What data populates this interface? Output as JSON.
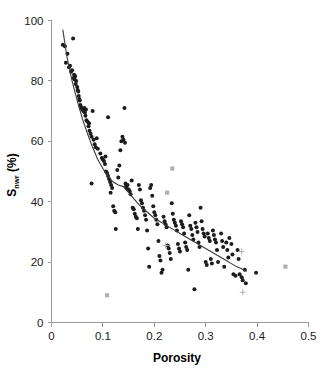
{
  "figure": {
    "width": 322,
    "height": 369,
    "background": "#ffffff",
    "top_fragment": "",
    "marker_color_dark": "#1c1c1c",
    "marker_color_gray": "#b0b0b0",
    "curve_color": "#3b3b3b",
    "axis_color": "#9a9a9a"
  },
  "chart_data": {
    "type": "scatter",
    "title": "",
    "subtitle": "",
    "xlabel": "Porosity",
    "ylabel_main": "S",
    "ylabel_sub": "nwr",
    "ylabel_unit": " (%)",
    "ylabel": "Snwr (%)",
    "xlim": [
      0,
      0.5
    ],
    "ylim": [
      0,
      100
    ],
    "xticks": [
      0,
      0.1,
      0.2,
      0.3,
      0.4,
      0.5
    ],
    "xticklabels": [
      "0",
      "0.1",
      "0.2",
      "0.3",
      "0.4",
      "0.5"
    ],
    "yticks": [
      0,
      20,
      40,
      60,
      80,
      100
    ],
    "yticklabels": [
      "0",
      "20",
      "40",
      "60",
      "80",
      "100"
    ],
    "grid": false,
    "legend": null,
    "annotations": [],
    "series": [
      {
        "name": "measurements-dark",
        "marker": "filled-circle",
        "color": "#1c1c1c",
        "points": [
          [
            0.022,
            92.0
          ],
          [
            0.026,
            91.5
          ],
          [
            0.028,
            86.0
          ],
          [
            0.031,
            89.0
          ],
          [
            0.034,
            84.5
          ],
          [
            0.036,
            85.0
          ],
          [
            0.038,
            83.0
          ],
          [
            0.04,
            83.5
          ],
          [
            0.042,
            94.0
          ],
          [
            0.043,
            81.0
          ],
          [
            0.044,
            82.0
          ],
          [
            0.045,
            80.5
          ],
          [
            0.046,
            81.5
          ],
          [
            0.047,
            79.0
          ],
          [
            0.048,
            80.0
          ],
          [
            0.05,
            78.0
          ],
          [
            0.051,
            77.0
          ],
          [
            0.052,
            76.5
          ],
          [
            0.053,
            75.0
          ],
          [
            0.054,
            74.0
          ],
          [
            0.055,
            73.5
          ],
          [
            0.056,
            72.0
          ],
          [
            0.057,
            71.5
          ],
          [
            0.058,
            71.0
          ],
          [
            0.06,
            70.5
          ],
          [
            0.062,
            70.0
          ],
          [
            0.064,
            71.0
          ],
          [
            0.065,
            69.5
          ],
          [
            0.066,
            68.5
          ],
          [
            0.067,
            70.5
          ],
          [
            0.068,
            67.0
          ],
          [
            0.07,
            66.5
          ],
          [
            0.072,
            65.0
          ],
          [
            0.073,
            66.0
          ],
          [
            0.074,
            63.5
          ],
          [
            0.076,
            62.5
          ],
          [
            0.078,
            61.5
          ],
          [
            0.08,
            70.0
          ],
          [
            0.082,
            60.5
          ],
          [
            0.084,
            59.0
          ],
          [
            0.086,
            58.0
          ],
          [
            0.088,
            61.0
          ],
          [
            0.09,
            57.5
          ],
          [
            0.078,
            46.0
          ],
          [
            0.095,
            56.0
          ],
          [
            0.098,
            54.5
          ],
          [
            0.1,
            54.0
          ],
          [
            0.102,
            53.5
          ],
          [
            0.104,
            52.5
          ],
          [
            0.105,
            55.0
          ],
          [
            0.106,
            50.0
          ],
          [
            0.108,
            49.5
          ],
          [
            0.11,
            48.5
          ],
          [
            0.11,
            68.0
          ],
          [
            0.112,
            47.5
          ],
          [
            0.114,
            46.5
          ],
          [
            0.115,
            43.0
          ],
          [
            0.116,
            45.5
          ],
          [
            0.118,
            44.5
          ],
          [
            0.12,
            38.5
          ],
          [
            0.122,
            37.0
          ],
          [
            0.124,
            36.5
          ],
          [
            0.125,
            31.0
          ],
          [
            0.128,
            50.5
          ],
          [
            0.13,
            48.0
          ],
          [
            0.132,
            52.0
          ],
          [
            0.134,
            57.0
          ],
          [
            0.136,
            60.0
          ],
          [
            0.138,
            61.5
          ],
          [
            0.14,
            60.5
          ],
          [
            0.142,
            71.0
          ],
          [
            0.143,
            59.5
          ],
          [
            0.144,
            46.0
          ],
          [
            0.145,
            45.0
          ],
          [
            0.146,
            44.5
          ],
          [
            0.148,
            45.5
          ],
          [
            0.15,
            44.0
          ],
          [
            0.152,
            43.5
          ],
          [
            0.154,
            42.5
          ],
          [
            0.156,
            47.0
          ],
          [
            0.158,
            38.0
          ],
          [
            0.16,
            37.5
          ],
          [
            0.162,
            36.0
          ],
          [
            0.164,
            35.0
          ],
          [
            0.166,
            34.5
          ],
          [
            0.168,
            31.0
          ],
          [
            0.17,
            45.5
          ],
          [
            0.172,
            44.0
          ],
          [
            0.174,
            40.5
          ],
          [
            0.176,
            39.5
          ],
          [
            0.178,
            38.0
          ],
          [
            0.18,
            37.0
          ],
          [
            0.182,
            35.5
          ],
          [
            0.184,
            34.0
          ],
          [
            0.186,
            30.5
          ],
          [
            0.188,
            24.5
          ],
          [
            0.19,
            18.5
          ],
          [
            0.192,
            44.5
          ],
          [
            0.194,
            45.5
          ],
          [
            0.196,
            42.0
          ],
          [
            0.198,
            38.5
          ],
          [
            0.2,
            36.5
          ],
          [
            0.202,
            35.5
          ],
          [
            0.204,
            34.0
          ],
          [
            0.206,
            32.5
          ],
          [
            0.208,
            27.0
          ],
          [
            0.21,
            22.0
          ],
          [
            0.212,
            20.5
          ],
          [
            0.214,
            16.5
          ],
          [
            0.216,
            17.5
          ],
          [
            0.218,
            35.0
          ],
          [
            0.22,
            33.5
          ],
          [
            0.222,
            32.5
          ],
          [
            0.224,
            31.5
          ],
          [
            0.226,
            25.5
          ],
          [
            0.228,
            24.5
          ],
          [
            0.23,
            23.0
          ],
          [
            0.232,
            21.0
          ],
          [
            0.234,
            39.5
          ],
          [
            0.236,
            36.0
          ],
          [
            0.238,
            34.0
          ],
          [
            0.24,
            33.0
          ],
          [
            0.242,
            32.0
          ],
          [
            0.244,
            30.5
          ],
          [
            0.246,
            26.0
          ],
          [
            0.248,
            24.5
          ],
          [
            0.25,
            23.5
          ],
          [
            0.252,
            33.5
          ],
          [
            0.254,
            32.5
          ],
          [
            0.256,
            31.5
          ],
          [
            0.258,
            29.5
          ],
          [
            0.26,
            26.5
          ],
          [
            0.262,
            25.0
          ],
          [
            0.264,
            24.0
          ],
          [
            0.266,
            17.5
          ],
          [
            0.268,
            35.5
          ],
          [
            0.27,
            32.0
          ],
          [
            0.272,
            31.0
          ],
          [
            0.274,
            29.0
          ],
          [
            0.276,
            27.5
          ],
          [
            0.278,
            11.0
          ],
          [
            0.28,
            33.0
          ],
          [
            0.282,
            31.5
          ],
          [
            0.284,
            30.0
          ],
          [
            0.286,
            26.5
          ],
          [
            0.288,
            25.0
          ],
          [
            0.29,
            38.0
          ],
          [
            0.292,
            33.5
          ],
          [
            0.294,
            31.0
          ],
          [
            0.296,
            29.5
          ],
          [
            0.298,
            28.5
          ],
          [
            0.3,
            20.0
          ],
          [
            0.302,
            19.0
          ],
          [
            0.304,
            29.5
          ],
          [
            0.306,
            28.0
          ],
          [
            0.308,
            27.0
          ],
          [
            0.31,
            21.0
          ],
          [
            0.312,
            19.5
          ],
          [
            0.314,
            30.5
          ],
          [
            0.316,
            29.0
          ],
          [
            0.318,
            27.5
          ],
          [
            0.32,
            26.5
          ],
          [
            0.322,
            24.0
          ],
          [
            0.324,
            20.0
          ],
          [
            0.33,
            29.5
          ],
          [
            0.332,
            27.0
          ],
          [
            0.334,
            25.0
          ],
          [
            0.336,
            18.5
          ],
          [
            0.34,
            26.5
          ],
          [
            0.342,
            24.0
          ],
          [
            0.344,
            21.5
          ],
          [
            0.346,
            28.0
          ],
          [
            0.35,
            26.0
          ],
          [
            0.352,
            22.5
          ],
          [
            0.354,
            16.0
          ],
          [
            0.358,
            15.5
          ],
          [
            0.362,
            24.0
          ],
          [
            0.364,
            21.0
          ],
          [
            0.366,
            16.0
          ],
          [
            0.37,
            15.0
          ],
          [
            0.372,
            14.0
          ],
          [
            0.376,
            17.5
          ],
          [
            0.378,
            13.0
          ],
          [
            0.398,
            16.5
          ]
        ]
      },
      {
        "name": "measurements-gray-square",
        "marker": "filled-square",
        "color": "#b0b0b0",
        "points": [
          [
            0.108,
            9.0
          ],
          [
            0.455,
            18.5
          ],
          [
            0.235,
            51.0
          ],
          [
            0.225,
            43.0
          ]
        ]
      },
      {
        "name": "measurements-gray-cross",
        "marker": "plus",
        "color": "#b5b5b5",
        "points": [
          [
            0.222,
            25.5
          ],
          [
            0.37,
            23.5
          ],
          [
            0.372,
            10.0
          ]
        ]
      }
    ],
    "trend": {
      "name": "fitted-curve",
      "style": "solid",
      "color": "#3b3b3b",
      "points": [
        [
          0.022,
          97.0
        ],
        [
          0.03,
          88.0
        ],
        [
          0.04,
          80.0
        ],
        [
          0.05,
          73.5
        ],
        [
          0.06,
          67.5
        ],
        [
          0.07,
          62.5
        ],
        [
          0.08,
          58.0
        ],
        [
          0.09,
          54.0
        ],
        [
          0.1,
          51.0
        ],
        [
          0.11,
          48.5
        ],
        [
          0.12,
          46.5
        ],
        [
          0.13,
          45.5
        ],
        [
          0.14,
          45.0
        ],
        [
          0.15,
          43.0
        ],
        [
          0.16,
          41.0
        ],
        [
          0.17,
          39.0
        ],
        [
          0.18,
          37.5
        ],
        [
          0.19,
          36.0
        ],
        [
          0.2,
          34.5
        ],
        [
          0.21,
          33.5
        ],
        [
          0.22,
          32.5
        ],
        [
          0.23,
          31.5
        ],
        [
          0.24,
          30.5
        ],
        [
          0.25,
          29.5
        ],
        [
          0.26,
          28.5
        ],
        [
          0.27,
          27.5
        ],
        [
          0.28,
          26.5
        ],
        [
          0.29,
          25.5
        ],
        [
          0.3,
          24.5
        ],
        [
          0.31,
          23.5
        ],
        [
          0.32,
          22.5
        ],
        [
          0.33,
          21.5
        ],
        [
          0.34,
          20.5
        ],
        [
          0.35,
          19.5
        ],
        [
          0.36,
          18.5
        ],
        [
          0.37,
          17.8
        ],
        [
          0.38,
          17.0
        ]
      ]
    }
  }
}
